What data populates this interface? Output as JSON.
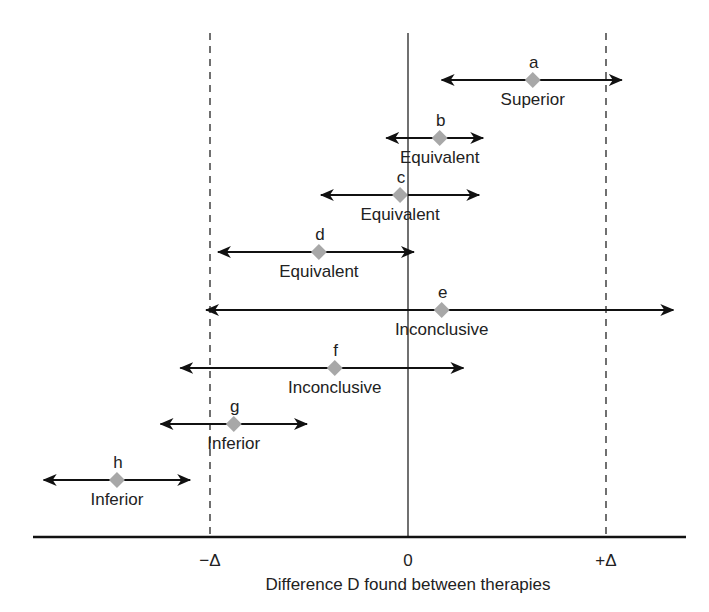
{
  "chart_data": {
    "type": "interval",
    "title": "",
    "xlabel": "Difference D found between therapies",
    "ylabel": "",
    "x_units": "Delta",
    "xlim": [
      -2.0,
      1.4
    ],
    "ticks": [
      {
        "value": -1,
        "label": "−Δ"
      },
      {
        "value": 0,
        "label": "0"
      },
      {
        "value": 1,
        "label": "+Δ"
      }
    ],
    "reference_lines": [
      {
        "value": -1,
        "style": "dashed"
      },
      {
        "value": 0,
        "style": "solid"
      },
      {
        "value": 1,
        "style": "dashed"
      }
    ],
    "grid": false,
    "legend": null,
    "intervals": [
      {
        "id": "a",
        "label": "Superior",
        "estimate": 0.63,
        "low": 0.17,
        "high": 1.08
      },
      {
        "id": "b",
        "label": "Equivalent",
        "estimate": 0.16,
        "low": -0.11,
        "high": 0.38
      },
      {
        "id": "c",
        "label": "Equivalent",
        "estimate": -0.04,
        "low": -0.44,
        "high": 0.36
      },
      {
        "id": "d",
        "label": "Equivalent",
        "estimate": -0.45,
        "low": -0.96,
        "high": 0.03
      },
      {
        "id": "e",
        "label": "Inconclusive",
        "estimate": 0.17,
        "low": -1.02,
        "high": 1.34
      },
      {
        "id": "f",
        "label": "Inconclusive",
        "estimate": -0.37,
        "low": -1.15,
        "high": 0.28
      },
      {
        "id": "g",
        "label": "Inferior",
        "estimate": -0.88,
        "low": -1.25,
        "high": -0.51
      },
      {
        "id": "h",
        "label": "Inferior",
        "estimate": -1.47,
        "low": -1.84,
        "high": -1.1
      }
    ],
    "colors": {
      "interval_line": "#111111",
      "estimate_marker": "#a8a8a8",
      "axis": "#111111",
      "text": "#222222"
    }
  }
}
